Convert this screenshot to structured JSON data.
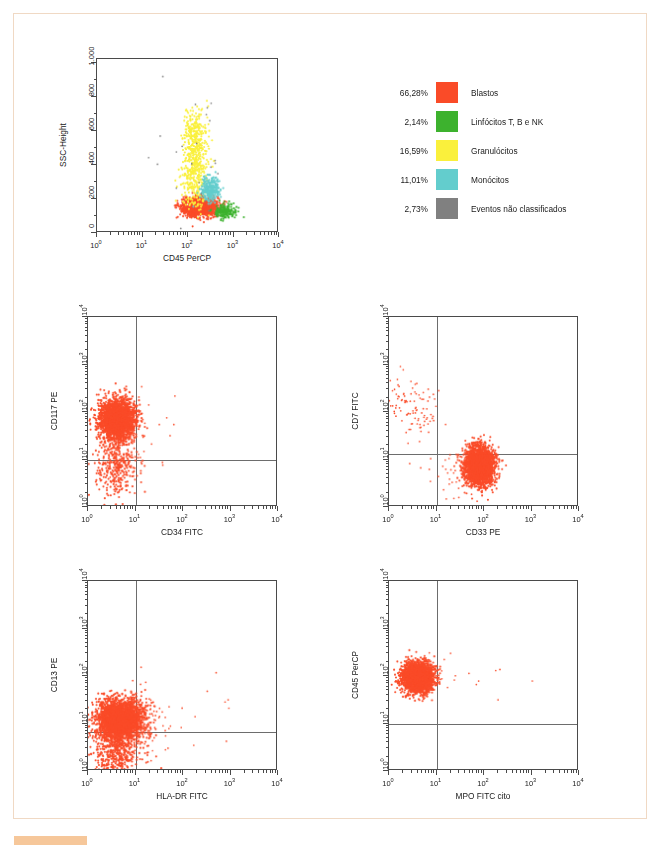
{
  "page": {
    "accent_color": "#f6c79a",
    "border_color": "#f0d9c4",
    "background": "#ffffff"
  },
  "legend": {
    "items": [
      {
        "percent": "66,28%",
        "label": "Blastos",
        "color": "#fa4b28",
        "swatch_name": "legend-swatch-blastos"
      },
      {
        "percent": "2,14%",
        "label": "Linfócitos T, B e NK",
        "color": "#3db22e",
        "swatch_name": "legend-swatch-linfocitos"
      },
      {
        "percent": "16,59%",
        "label": "Granulócitos",
        "color": "#faf03c",
        "swatch_name": "legend-swatch-granulocitos"
      },
      {
        "percent": "11,01%",
        "label": "Monócitos",
        "color": "#63cdcd",
        "swatch_name": "legend-swatch-monocitos"
      },
      {
        "percent": "2,73%",
        "label": "Eventos não classificados",
        "color": "#808080",
        "swatch_name": "legend-swatch-nao-classificados"
      }
    ]
  },
  "chart_data": [
    {
      "id": "ssc-cd45",
      "type": "scatter",
      "panel_letter": "",
      "title": "",
      "xlabel": "CD45 PerCP",
      "ylabel": "SSC-Height",
      "x_scale": "log",
      "y_scale": "linear",
      "xlim": [
        1,
        10000
      ],
      "ylim": [
        0,
        1023
      ],
      "x_ticks": [
        "10",
        "10",
        "10",
        "10",
        "10"
      ],
      "x_tick_exponents": [
        "0",
        "1",
        "2",
        "3",
        "4"
      ],
      "y_ticks": [
        "0",
        "200",
        "400",
        "600",
        "800",
        "1.000"
      ],
      "y_tick_values": [
        0,
        200,
        400,
        600,
        800,
        1000
      ],
      "grid": false,
      "quadrants": null,
      "clusters": [
        {
          "name": "Blastos",
          "color": "#fa4b28",
          "n": 1500,
          "cx_log": 2.28,
          "cy": 145,
          "sx_log": 0.19,
          "sy": 28,
          "shape": "ellipse"
        },
        {
          "name": "Linfócitos T, B e NK",
          "color": "#3db22e",
          "n": 180,
          "cx_log": 2.85,
          "cy": 118,
          "sx_log": 0.13,
          "sy": 22,
          "shape": "ellipse"
        },
        {
          "name": "Granulócitos",
          "color": "#faf03c",
          "n": 640,
          "cx_log": 2.18,
          "cy": 420,
          "sx_log": 0.14,
          "sy": 170,
          "shape": "column"
        },
        {
          "name": "Monócitos",
          "color": "#63cdcd",
          "n": 280,
          "cx_log": 2.52,
          "cy": 245,
          "sx_log": 0.1,
          "sy": 38,
          "shape": "ellipse"
        },
        {
          "name": "Eventos não classificados",
          "color": "#808080",
          "n": 26,
          "cx_log": 2.2,
          "cy": 330,
          "sx_log": 0.55,
          "sy": 230,
          "shape": "sparse"
        }
      ]
    },
    {
      "id": "panel-a",
      "type": "scatter",
      "panel_letter": "A",
      "title": "",
      "xlabel": "CD34 FITC",
      "ylabel": "CD117 PE",
      "x_scale": "log",
      "y_scale": "log",
      "xlim": [
        1,
        10000
      ],
      "ylim": [
        1,
        10000
      ],
      "x_ticks": [
        "10",
        "10",
        "10",
        "10",
        "10"
      ],
      "x_tick_exponents": [
        "0",
        "1",
        "2",
        "3",
        "4"
      ],
      "y_ticks": [
        "10",
        "10",
        "10",
        "10",
        "10"
      ],
      "y_tick_exponents": [
        "0",
        "1",
        "2",
        "3",
        "4"
      ],
      "grid": false,
      "quadrants": {
        "x": 10,
        "y": 10
      },
      "clusters": [
        {
          "name": "main",
          "color": "#fa4b28",
          "n": 2600,
          "cx_log": 0.62,
          "cy_log": 1.82,
          "sx_log": 0.19,
          "sy_log": 0.21,
          "shape": "ellipse"
        },
        {
          "name": "tail-low",
          "color": "#fa4b28",
          "n": 330,
          "cx_log": 0.58,
          "cy_log": 0.82,
          "sx_log": 0.22,
          "sy_log": 0.33,
          "shape": "ellipse"
        },
        {
          "name": "scatter-sparse",
          "color": "#fa4b28",
          "n": 28,
          "cx_log": 1.05,
          "cy_log": 1.55,
          "sx_log": 0.35,
          "sy_log": 0.45,
          "shape": "sparse"
        }
      ]
    },
    {
      "id": "panel-b",
      "type": "scatter",
      "panel_letter": "B",
      "title": "",
      "xlabel": "CD33 PE",
      "ylabel": "CD7 FITC",
      "x_scale": "log",
      "y_scale": "log",
      "xlim": [
        1,
        10000
      ],
      "ylim": [
        1,
        10000
      ],
      "x_ticks": [
        "10",
        "10",
        "10",
        "10",
        "10"
      ],
      "x_tick_exponents": [
        "0",
        "1",
        "2",
        "3",
        "4"
      ],
      "y_ticks": [
        "10",
        "10",
        "10",
        "10",
        "10"
      ],
      "y_tick_exponents": [
        "0",
        "1",
        "2",
        "3",
        "4"
      ],
      "grid": false,
      "quadrants": {
        "x": 10,
        "y": 13
      },
      "clusters": [
        {
          "name": "main-cd33pos",
          "color": "#fa4b28",
          "n": 2700,
          "cx_log": 1.92,
          "cy_log": 0.83,
          "sx_log": 0.155,
          "sy_log": 0.2,
          "shape": "ellipse"
        },
        {
          "name": "cd7-pos-sparse",
          "color": "#fa4b28",
          "n": 105,
          "cx_log": 0.42,
          "cy_log": 2.12,
          "sx_log": 0.25,
          "sy_log": 0.25,
          "shape": "sparse"
        },
        {
          "name": "low-sparse",
          "color": "#fa4b28",
          "n": 35,
          "cx_log": 1.25,
          "cy_log": 0.72,
          "sx_log": 0.35,
          "sy_log": 0.33,
          "shape": "sparse"
        }
      ]
    },
    {
      "id": "panel-c",
      "type": "scatter",
      "panel_letter": "C",
      "title": "",
      "xlabel": "HLA-DR FITC",
      "ylabel": "CD13 PE",
      "x_scale": "log",
      "y_scale": "log",
      "xlim": [
        1,
        10000
      ],
      "ylim": [
        1,
        10000
      ],
      "x_ticks": [
        "10",
        "10",
        "10",
        "10",
        "10"
      ],
      "x_tick_exponents": [
        "0",
        "1",
        "2",
        "3",
        "4"
      ],
      "y_ticks": [
        "10",
        "10",
        "10",
        "10",
        "10"
      ],
      "y_tick_exponents": [
        "0",
        "1",
        "2",
        "3",
        "4"
      ],
      "grid": false,
      "quadrants": {
        "x": 10,
        "y": 6.5
      },
      "clusters": [
        {
          "name": "main",
          "color": "#fa4b28",
          "n": 2900,
          "cx_log": 0.68,
          "cy_log": 1.05,
          "sx_log": 0.24,
          "sy_log": 0.22,
          "shape": "ellipse"
        },
        {
          "name": "low-tail",
          "color": "#fa4b28",
          "n": 420,
          "cx_log": 0.62,
          "cy_log": 0.35,
          "sx_log": 0.26,
          "sy_log": 0.25,
          "shape": "ellipse"
        },
        {
          "name": "right-sparse",
          "color": "#fa4b28",
          "n": 90,
          "cx_log": 1.22,
          "cy_log": 1.02,
          "sx_log": 0.22,
          "sy_log": 0.28,
          "shape": "sparse"
        },
        {
          "name": "far-sparse",
          "color": "#fa4b28",
          "n": 12,
          "cx_log": 2.2,
          "cy_log": 1.2,
          "sx_log": 0.55,
          "sy_log": 0.6,
          "shape": "sparse"
        }
      ]
    },
    {
      "id": "panel-d",
      "type": "scatter",
      "panel_letter": "D",
      "title": "",
      "xlabel": "MPO FITC cito",
      "ylabel": "CD45 PerCP",
      "x_scale": "log",
      "y_scale": "log",
      "xlim": [
        1,
        10000
      ],
      "ylim": [
        1,
        10000
      ],
      "x_ticks": [
        "10",
        "10",
        "10",
        "10",
        "10"
      ],
      "x_tick_exponents": [
        "0",
        "1",
        "2",
        "3",
        "4"
      ],
      "y_ticks": [
        "10",
        "10",
        "10",
        "10",
        "10"
      ],
      "y_tick_exponents": [
        "0",
        "1",
        "2",
        "3",
        "4"
      ],
      "grid": false,
      "quadrants": {
        "x": 10,
        "y": 10
      },
      "clusters": [
        {
          "name": "main",
          "color": "#fa4b28",
          "n": 2800,
          "cx_log": 0.62,
          "cy_log": 1.95,
          "sx_log": 0.16,
          "sy_log": 0.155,
          "shape": "ellipse"
        },
        {
          "name": "right-sparse",
          "color": "#fa4b28",
          "n": 16,
          "cx_log": 1.15,
          "cy_log": 2.0,
          "sx_log": 0.3,
          "sy_log": 0.2,
          "shape": "sparse"
        },
        {
          "name": "far-sparse",
          "color": "#fa4b28",
          "n": 4,
          "cx_log": 2.4,
          "cy_log": 1.95,
          "sx_log": 0.4,
          "sy_log": 0.3,
          "shape": "sparse"
        }
      ]
    }
  ],
  "layout": {
    "plots": [
      {
        "id": "ssc-cd45",
        "frame_left": 96,
        "frame_top": 58,
        "frame_width": 182,
        "frame_height": 174
      },
      {
        "id": "panel-a",
        "frame_left": 87,
        "frame_top": 316,
        "frame_width": 190,
        "frame_height": 190
      },
      {
        "id": "panel-b",
        "frame_left": 388,
        "frame_top": 316,
        "frame_width": 190,
        "frame_height": 190
      },
      {
        "id": "panel-c",
        "frame_left": 87,
        "frame_top": 580,
        "frame_width": 190,
        "frame_height": 190
      },
      {
        "id": "panel-d",
        "frame_left": 388,
        "frame_top": 580,
        "frame_width": 190,
        "frame_height": 190
      }
    ]
  }
}
